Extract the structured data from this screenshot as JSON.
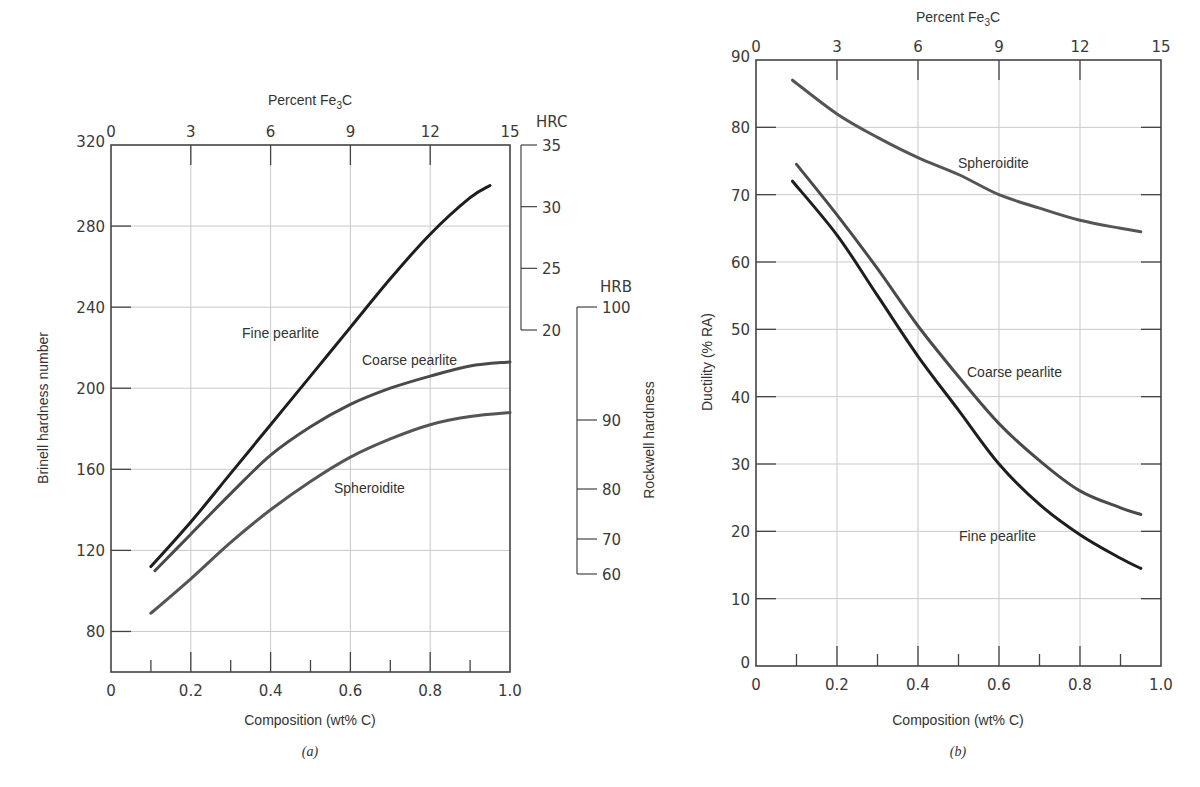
{
  "chart_data": [
    {
      "id": "a",
      "type": "line",
      "caption": "(a)",
      "title": "",
      "xlabel": "Composition (wt% C)",
      "ylabel": "Brinell hardness number",
      "top_xlabel": "Percent Fe3C",
      "top_xlabel_parts": {
        "pre": "Percent Fe",
        "sub": "3",
        "post": "C"
      },
      "xlim": [
        0,
        1.0
      ],
      "ylim": [
        60,
        320
      ],
      "xticks": [
        "0",
        "0.2",
        "0.4",
        "0.6",
        "0.8",
        "1.0"
      ],
      "yticks": [
        "80",
        "120",
        "160",
        "200",
        "240",
        "280",
        "320"
      ],
      "top_xticks": [
        "0",
        "3",
        "6",
        "9",
        "12",
        "15"
      ],
      "grid": true,
      "secondary_axes": [
        {
          "name": "HRC",
          "label": "HRC",
          "ticks": [
            "35",
            "30",
            "25",
            "20"
          ]
        },
        {
          "name": "HRB",
          "label": "HRB",
          "ticks": [
            "100",
            "90",
            "80",
            "70",
            "60"
          ],
          "axis_title": "Rockwell hardness"
        }
      ],
      "series": [
        {
          "name": "Fine pearlite",
          "color": "#1e1e1e",
          "x": [
            0.1,
            0.2,
            0.3,
            0.4,
            0.5,
            0.6,
            0.7,
            0.8,
            0.9,
            0.95
          ],
          "y": [
            112,
            134,
            158,
            182,
            206,
            230,
            254,
            276,
            294,
            300
          ]
        },
        {
          "name": "Coarse pearlite",
          "color": "#4a4a4a",
          "x": [
            0.11,
            0.2,
            0.3,
            0.4,
            0.5,
            0.6,
            0.7,
            0.8,
            0.9,
            1.0
          ],
          "y": [
            110,
            128,
            148,
            167,
            181,
            192,
            200,
            206,
            211,
            213
          ]
        },
        {
          "name": "Spheroidite",
          "color": "#555555",
          "x": [
            0.1,
            0.2,
            0.3,
            0.4,
            0.5,
            0.6,
            0.7,
            0.8,
            0.9,
            1.0
          ],
          "y": [
            89,
            106,
            124,
            140,
            154,
            166,
            175,
            182,
            186,
            188
          ]
        }
      ],
      "annotations": [
        "Fine pearlite",
        "Coarse pearlite",
        "Spheroidite"
      ]
    },
    {
      "id": "b",
      "type": "line",
      "caption": "(b)",
      "title": "",
      "xlabel": "Composition (wt% C)",
      "ylabel": "Ductility (% RA)",
      "top_xlabel": "Percent Fe3C",
      "top_xlabel_parts": {
        "pre": "Percent Fe",
        "sub": "3",
        "post": "C"
      },
      "xlim": [
        0,
        1.0
      ],
      "ylim": [
        0,
        90
      ],
      "xticks": [
        "0",
        "0.2",
        "0.4",
        "0.6",
        "0.8",
        "1.0"
      ],
      "yticks": [
        "0",
        "10",
        "20",
        "30",
        "40",
        "50",
        "60",
        "70",
        "80",
        "90"
      ],
      "top_xticks": [
        "0",
        "3",
        "6",
        "9",
        "12",
        "15"
      ],
      "grid": true,
      "series": [
        {
          "name": "Spheroidite",
          "color": "#555555",
          "x": [
            0.09,
            0.2,
            0.3,
            0.4,
            0.5,
            0.6,
            0.7,
            0.8,
            0.9,
            0.95
          ],
          "y": [
            87,
            82,
            78.5,
            75.5,
            73,
            70,
            68,
            66.2,
            65,
            64.5
          ]
        },
        {
          "name": "Coarse pearlite",
          "color": "#4a4a4a",
          "x": [
            0.1,
            0.2,
            0.3,
            0.4,
            0.5,
            0.6,
            0.7,
            0.8,
            0.9,
            0.95
          ],
          "y": [
            74.5,
            67,
            59,
            50.5,
            43,
            36,
            30.5,
            26,
            23.5,
            22.5
          ]
        },
        {
          "name": "Fine pearlite",
          "color": "#1e1e1e",
          "x": [
            0.09,
            0.2,
            0.3,
            0.4,
            0.5,
            0.6,
            0.7,
            0.8,
            0.9,
            0.95
          ],
          "y": [
            72,
            64,
            55,
            46,
            38,
            30,
            24,
            19.5,
            16,
            14.5
          ]
        }
      ],
      "annotations": [
        "Spheroidite",
        "Coarse pearlite",
        "Fine pearlite"
      ]
    }
  ]
}
